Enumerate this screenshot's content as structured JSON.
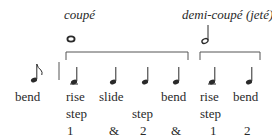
{
  "headings": {
    "coupe": "coupé",
    "demi_coupe": "demi-coupé (jeté)"
  },
  "lead": {
    "note": "eighth-note",
    "label": "bend"
  },
  "beats": [
    {
      "note": "quarter",
      "words": [
        "rise",
        "step"
      ],
      "count": "1"
    },
    {
      "note": "quarter",
      "words": [
        "slide",
        ""
      ],
      "count": "&"
    },
    {
      "note": "quarter",
      "words": [
        "",
        "step"
      ],
      "count": "2"
    },
    {
      "note": "quarter",
      "words": [
        "bend",
        ""
      ],
      "count": "&"
    },
    {
      "note": "quarter",
      "words": [
        "rise",
        "step"
      ],
      "count": "1"
    },
    {
      "note": "quarter",
      "words": [
        "bend",
        ""
      ],
      "count": "2"
    }
  ],
  "brackets": [
    {
      "label": "coupé",
      "symbol": "whole-note",
      "spans_beats": [
        1,
        4
      ]
    },
    {
      "label": "demi-coupé (jeté)",
      "symbol": "half-note",
      "spans_beats": [
        5,
        6
      ]
    }
  ],
  "colors": {
    "ink": "#2a2a2a",
    "rule": "#555555"
  }
}
